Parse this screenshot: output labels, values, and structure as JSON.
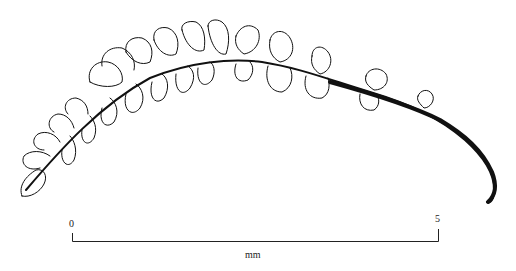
{
  "figure": {
    "scale_bar": {
      "start_label": "0",
      "end_label": "5",
      "unit_label": "mm"
    },
    "colors": {
      "ink": "#111111",
      "background": "#ffffff"
    }
  }
}
